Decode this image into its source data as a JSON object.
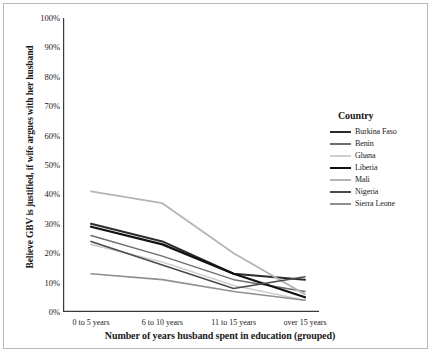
{
  "chart_data": {
    "type": "line",
    "title": "",
    "xlabel": "Number of years husband spent in education (grouped)",
    "ylabel": "Believe GBV is justified, if wife argues with her husband",
    "categories": [
      "0 to 5 years",
      "6 to 10 years",
      "11 to 15 years",
      "over 15 years"
    ],
    "ylim": [
      0,
      100
    ],
    "ytick_labels": [
      "0%",
      "10%",
      "20%",
      "30%",
      "40%",
      "50%",
      "60%",
      "70%",
      "80%",
      "90%",
      "100%"
    ],
    "ytick_values": [
      0,
      10,
      20,
      30,
      40,
      50,
      60,
      70,
      80,
      90,
      100
    ],
    "grid": false,
    "legend_position": "right",
    "legend_title": "Country",
    "series": [
      {
        "name": "Burkina Faso",
        "values": [
          30,
          24,
          13,
          11
        ],
        "color": "#2b2b2b"
      },
      {
        "name": "Benin",
        "values": [
          26,
          19,
          11,
          7
        ],
        "color": "#6e6e6e"
      },
      {
        "name": "Ghana",
        "values": [
          23,
          17,
          9,
          4
        ],
        "color": "#cfcfcf"
      },
      {
        "name": "Liberia",
        "values": [
          29,
          23,
          13,
          5
        ],
        "color": "#111111"
      },
      {
        "name": "Mali",
        "values": [
          41,
          37,
          20,
          6
        ],
        "color": "#b5b5b5"
      },
      {
        "name": "Nigeria",
        "values": [
          24,
          16,
          8,
          12
        ],
        "color": "#4a4a4a"
      },
      {
        "name": "Sierra Leone",
        "values": [
          13,
          11,
          7,
          4
        ],
        "color": "#8f8f8f"
      }
    ]
  },
  "axis": {
    "y_title": "Believe GBV is justified, if wife argues with her husband",
    "x_title": "Number of years husband spent in education (grouped)"
  },
  "legend": {
    "title": "Country"
  }
}
